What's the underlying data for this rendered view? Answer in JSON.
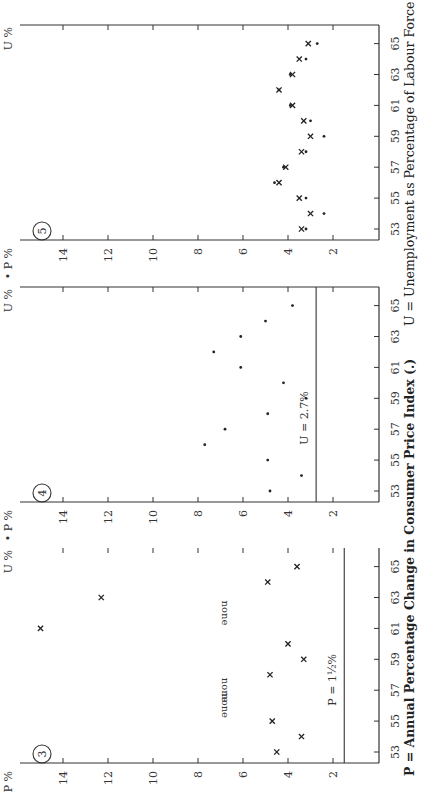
{
  "figure": {
    "orientation": "rotated -90deg (landscape page printed sideways)",
    "caption_left": "P = Annual Percentage Change in Consumer Price Index (.)",
    "caption_right": "U = Unemployment as Percentage of Labour Force (x)"
  },
  "axes": {
    "y_label": "P",
    "y_unit": "%",
    "y_ticks": [
      "14",
      "12",
      "10",
      "8",
      "6",
      "4",
      "2"
    ],
    "x_label": "U",
    "x_unit": "%",
    "x_ticks": [
      "53",
      "55",
      "57",
      "59",
      "61",
      "63",
      "65"
    ]
  },
  "panels": [
    {
      "id": "3",
      "badge": "3",
      "reference_label": "P = 1½%",
      "none_label": "none"
    },
    {
      "id": "4",
      "badge": "4",
      "reference_label": "U = 2.7%"
    },
    {
      "id": "5",
      "badge": "5"
    }
  ],
  "chart_data": [
    {
      "type": "scatter",
      "title": "Panel 3",
      "xlabel": "Year (19xx)",
      "ylabel": "U / P %",
      "ylim": [
        0,
        16
      ],
      "x_ticks": [
        53,
        55,
        57,
        59,
        61,
        63,
        65
      ],
      "y_ticks": [
        2,
        4,
        6,
        8,
        10,
        12,
        14
      ],
      "series": [
        {
          "name": "U (x)",
          "marker": "x",
          "points": [
            [
              53,
              4.5
            ],
            [
              54,
              3.4
            ],
            [
              55,
              4.7
            ],
            [
              58,
              4.8
            ],
            [
              59,
              3.3
            ],
            [
              60,
              4.0
            ],
            [
              61,
              15.0
            ],
            [
              63,
              12.3
            ],
            [
              64,
              4.9
            ],
            [
              65,
              3.6
            ]
          ]
        }
      ],
      "annotations": [
        {
          "text": "none",
          "x": 56
        },
        {
          "text": "none",
          "x": 57
        },
        {
          "text": "none",
          "x": 62
        },
        {
          "text": "P = 1½%",
          "type": "reference_line",
          "y": 1.5
        }
      ]
    },
    {
      "type": "scatter",
      "title": "Panel 4",
      "xlabel": "Year (19xx)",
      "ylabel": "P %",
      "ylim": [
        0,
        16
      ],
      "x_ticks": [
        53,
        55,
        57,
        59,
        61,
        63,
        65
      ],
      "y_ticks": [
        2,
        4,
        6,
        8,
        10,
        12,
        14
      ],
      "series": [
        {
          "name": "P (.)",
          "marker": "dot",
          "points": [
            [
              53,
              4.8
            ],
            [
              54,
              3.4
            ],
            [
              55,
              4.9
            ],
            [
              56,
              7.7
            ],
            [
              57,
              6.8
            ],
            [
              58,
              4.9
            ],
            [
              59,
              3.2
            ],
            [
              60,
              4.2
            ],
            [
              61,
              6.1
            ],
            [
              62,
              7.3
            ],
            [
              63,
              6.1
            ],
            [
              64,
              5.0
            ],
            [
              65,
              3.8
            ]
          ]
        }
      ],
      "annotations": [
        {
          "text": "U = 2.7%",
          "type": "reference_line",
          "y": 2.75
        }
      ]
    },
    {
      "type": "scatter",
      "title": "Panel 5",
      "xlabel": "Year (19xx)",
      "ylabel": "P / U %",
      "ylim": [
        0,
        16
      ],
      "x_ticks": [
        53,
        55,
        57,
        59,
        61,
        63,
        65
      ],
      "y_ticks": [
        2,
        4,
        6,
        8,
        10,
        12,
        14
      ],
      "series": [
        {
          "name": "U (x)",
          "marker": "x",
          "points": [
            [
              53,
              3.4
            ],
            [
              54,
              3.0
            ],
            [
              55,
              3.5
            ],
            [
              56,
              4.4
            ],
            [
              57,
              4.1
            ],
            [
              58,
              3.4
            ],
            [
              59,
              3.0
            ],
            [
              60,
              3.3
            ],
            [
              61,
              3.8
            ],
            [
              62,
              4.4
            ],
            [
              63,
              3.8
            ],
            [
              64,
              3.5
            ],
            [
              65,
              3.1
            ]
          ]
        },
        {
          "name": "P (.)",
          "marker": "dot",
          "points": [
            [
              53,
              3.2
            ],
            [
              54,
              2.4
            ],
            [
              55,
              3.2
            ],
            [
              56,
              4.6
            ],
            [
              57,
              4.2
            ],
            [
              58,
              3.2
            ],
            [
              59,
              2.4
            ],
            [
              60,
              3.0
            ],
            [
              61,
              3.9
            ],
            [
              62,
              4.4
            ],
            [
              63,
              3.9
            ],
            [
              64,
              3.2
            ],
            [
              65,
              2.7
            ]
          ]
        }
      ]
    }
  ]
}
